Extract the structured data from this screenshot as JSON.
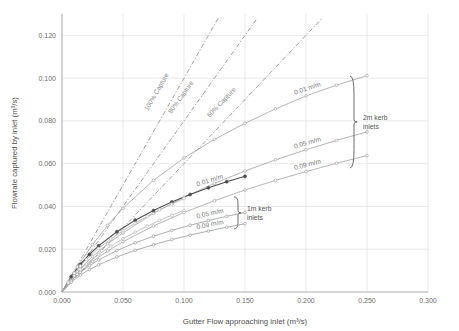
{
  "chart_data": {
    "type": "line",
    "title": "",
    "xlabel": "Gutter Flow approaching inlet (m³/s)",
    "ylabel": "Flowrate captured by inlet (m³/s)",
    "xlim": [
      0.0,
      0.3
    ],
    "ylim": [
      0.0,
      0.13
    ],
    "xticks": [
      "0.000",
      "0.050",
      "0.100",
      "0.150",
      "0.200",
      "0.250",
      "0.300"
    ],
    "xtick_values": [
      0.0,
      0.05,
      0.1,
      0.15,
      0.2,
      0.25,
      0.3
    ],
    "yticks": [
      "0.000",
      "0.020",
      "0.040",
      "0.060",
      "0.080",
      "0.100",
      "0.120"
    ],
    "ytick_values": [
      0.0,
      0.02,
      0.04,
      0.06,
      0.08,
      0.1,
      0.12
    ],
    "grid": true,
    "legend": "annotations",
    "reference_lines": [
      {
        "label": "100% Capture",
        "style": "dash-dot",
        "slope": 1.0,
        "color": "#8f8f8f",
        "x": [
          0.0,
          0.128
        ],
        "y": [
          0.0,
          0.128
        ]
      },
      {
        "label": "80% Capture",
        "style": "dash-dot",
        "slope": 0.8,
        "color": "#8f8f8f",
        "x": [
          0.0,
          0.16
        ],
        "y": [
          0.0,
          0.128
        ]
      },
      {
        "label": "60% Capture",
        "style": "dash-dot",
        "slope": 0.6,
        "color": "#8f8f8f",
        "x": [
          0.0,
          0.2133
        ],
        "y": [
          0.0,
          0.128
        ]
      }
    ],
    "series": [
      {
        "name": "2m kerb inlets 0.01 m/m",
        "group": "2m kerb inlets",
        "slope_label": "0.01 m/m",
        "color": "#a3a3a3",
        "marker": "circle",
        "x": [
          0.0,
          0.0125,
          0.025,
          0.0375,
          0.05,
          0.075,
          0.1,
          0.125,
          0.15,
          0.175,
          0.2,
          0.225,
          0.25
        ],
        "y": [
          0.0,
          0.0117,
          0.0222,
          0.0312,
          0.0392,
          0.0522,
          0.0627,
          0.0714,
          0.0789,
          0.0856,
          0.0917,
          0.0967,
          0.1012
        ]
      },
      {
        "name": "2m kerb inlets 0.05 m/m",
        "group": "2m kerb inlets",
        "slope_label": "0.05 m/m",
        "color": "#a3a3a3",
        "marker": "circle",
        "x": [
          0.0,
          0.0125,
          0.025,
          0.0375,
          0.05,
          0.075,
          0.1,
          0.125,
          0.15,
          0.175,
          0.2,
          0.225,
          0.25
        ],
        "y": [
          0.0,
          0.0094,
          0.0166,
          0.0225,
          0.0277,
          0.0368,
          0.0443,
          0.0508,
          0.0566,
          0.0618,
          0.0665,
          0.0709,
          0.0749
        ]
      },
      {
        "name": "2m kerb inlets 0.09 m/m",
        "group": "2m kerb inlets",
        "slope_label": "0.09 m/m",
        "color": "#a3a3a3",
        "marker": "circle",
        "x": [
          0.0,
          0.0125,
          0.025,
          0.0375,
          0.05,
          0.075,
          0.1,
          0.125,
          0.15,
          0.175,
          0.2,
          0.225,
          0.25
        ],
        "y": [
          0.0,
          0.0083,
          0.0143,
          0.0192,
          0.0235,
          0.0309,
          0.0372,
          0.0427,
          0.0477,
          0.0522,
          0.0563,
          0.0602,
          0.0638
        ]
      },
      {
        "name": "1m kerb inlets 0.01 m/m",
        "group": "1m kerb inlets",
        "slope_label": "0.01 m/m",
        "color": "#4d4d4d",
        "marker": "circle",
        "x": [
          0.0,
          0.0075,
          0.015,
          0.0225,
          0.03,
          0.045,
          0.06,
          0.075,
          0.09,
          0.105,
          0.12,
          0.135,
          0.15
        ],
        "y": [
          0.0,
          0.0072,
          0.0129,
          0.0176,
          0.0216,
          0.0282,
          0.0336,
          0.0381,
          0.0421,
          0.0456,
          0.0487,
          0.0516,
          0.0541
        ]
      },
      {
        "name": "1m kerb inlets 0.05 m/m",
        "group": "1m kerb inlets",
        "slope_label": "0.05 m/m",
        "color": "#9a9a9a",
        "marker": "circle",
        "x": [
          0.0,
          0.0075,
          0.015,
          0.0225,
          0.03,
          0.045,
          0.06,
          0.075,
          0.09,
          0.105,
          0.12,
          0.135,
          0.15
        ],
        "y": [
          0.0,
          0.0053,
          0.0092,
          0.0123,
          0.015,
          0.0194,
          0.023,
          0.0261,
          0.0288,
          0.0312,
          0.0334,
          0.0354,
          0.0372
        ]
      },
      {
        "name": "1m kerb inlets 0.09 m/m",
        "group": "1m kerb inlets",
        "slope_label": "0.09 m/m",
        "color": "#9a9a9a",
        "marker": "circle",
        "x": [
          0.0,
          0.0075,
          0.015,
          0.0225,
          0.03,
          0.045,
          0.06,
          0.075,
          0.09,
          0.105,
          0.12,
          0.135,
          0.15
        ],
        "y": [
          0.0,
          0.0046,
          0.0079,
          0.0105,
          0.0127,
          0.0164,
          0.0195,
          0.0221,
          0.0245,
          0.0266,
          0.0285,
          0.0303,
          0.0319
        ]
      },
      {
        "name": "upper fan series a",
        "group": "unlabelled",
        "slope_label": "",
        "color": "#b5b5b5",
        "marker": "circle",
        "x": [
          0.0,
          0.005,
          0.01,
          0.015,
          0.02,
          0.03,
          0.04,
          0.05,
          0.06,
          0.07,
          0.08,
          0.09,
          0.1
        ],
        "y": [
          0.0,
          0.0048,
          0.0088,
          0.0122,
          0.0152,
          0.0204,
          0.0248,
          0.0287,
          0.0322,
          0.0354,
          0.0384,
          0.0411,
          0.0437
        ]
      },
      {
        "name": "upper fan series b",
        "group": "unlabelled",
        "slope_label": "",
        "color": "#b5b5b5",
        "marker": "circle",
        "x": [
          0.0,
          0.005,
          0.01,
          0.015,
          0.02,
          0.03,
          0.04,
          0.05,
          0.06,
          0.07,
          0.08,
          0.09,
          0.1
        ],
        "y": [
          0.0,
          0.0042,
          0.0076,
          0.0105,
          0.0131,
          0.0176,
          0.0215,
          0.0249,
          0.028,
          0.0308,
          0.0335,
          0.0359,
          0.0382
        ]
      }
    ],
    "group_annotations": [
      {
        "label": "2m kerb inlets",
        "line1": "2m kerb",
        "line2": "inlets",
        "bracket_top_y": 0.101,
        "bracket_bottom_y": 0.058
      },
      {
        "label": "1m kerb inlets",
        "line1": "1m kerb",
        "line2": "inlets",
        "bracket_top_y": 0.0445,
        "bracket_bottom_y": 0.0295
      }
    ]
  },
  "axes": {
    "x_title": "Gutter Flow approaching inlet (m³/s)",
    "y_title": "Flowrate captured by inlet (m³/s)",
    "x_ticks": [
      "0.000",
      "0.050",
      "0.100",
      "0.150",
      "0.200",
      "0.250",
      "0.300"
    ],
    "y_ticks": [
      "0.000",
      "0.020",
      "0.040",
      "0.060",
      "0.080",
      "0.100",
      "0.120"
    ]
  },
  "annotations": {
    "capture_100": "100% Capture",
    "capture_80": "80% Capture",
    "capture_60": "60% Capture",
    "series_2m_001": "0.01 m/m",
    "series_2m_005": "0.05 m/m",
    "series_2m_009": "0.09 m/m",
    "series_1m_001": "0.01 m/m",
    "series_1m_005": "0.05 m/m",
    "series_1m_009": "0.09 m/m",
    "group_2m_line1": "2m kerb",
    "group_2m_line2": "inlets",
    "group_1m_line1": "1m kerb",
    "group_1m_line2": "inlets"
  },
  "colors": {
    "grid": "#e3e3e3",
    "axis": "#b8b8b8",
    "text": "#5a5a5a",
    "reference": "#9a9a9a",
    "series_light": "#a8a8a8",
    "series_dark": "#4d4d4d",
    "background": "#ffffff"
  }
}
